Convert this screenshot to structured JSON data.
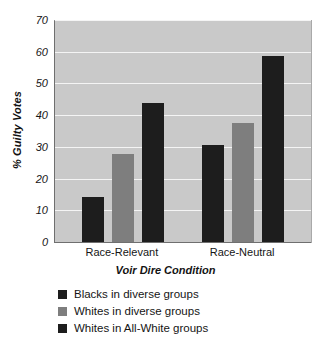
{
  "chart_data": {
    "type": "bar",
    "title": "",
    "xlabel": "Voir Dire Condition",
    "ylabel": "% Guilty Votes",
    "categories": [
      "Race-Relevant",
      "Race-Neutral"
    ],
    "series": [
      {
        "name": "Blacks in diverse groups",
        "color": "#1d1d1d",
        "values": [
          14.5,
          31
        ]
      },
      {
        "name": "Whites in diverse groups",
        "color": "#7e7e7e",
        "values": [
          28,
          38
        ]
      },
      {
        "name": "Whites in All-White groups",
        "color": "#1d1d1d",
        "values": [
          44,
          59
        ]
      }
    ],
    "ylim": [
      0,
      70
    ],
    "yticks": [
      0,
      10,
      20,
      30,
      40,
      50,
      60,
      70
    ],
    "ytick_labels": [
      "0",
      "10",
      "20",
      "30",
      "40",
      "50",
      "60",
      "70"
    ],
    "grid": true,
    "grid_color": "#f4f4f4",
    "plot_background": "#c9c9c9",
    "figure_background": "#ffffff",
    "legend_position": "below-axes-left"
  }
}
